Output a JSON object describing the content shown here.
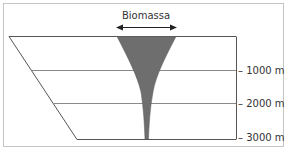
{
  "diagram": {
    "title": "Biomassa",
    "depth_labels": [
      "– 1000 m",
      "– 2000 m",
      "– 3000 m"
    ],
    "colors": {
      "biomass_fill": "#6e6e6e",
      "lines": "#555555",
      "frame": "#bdbdbd",
      "text": "#333333"
    }
  }
}
